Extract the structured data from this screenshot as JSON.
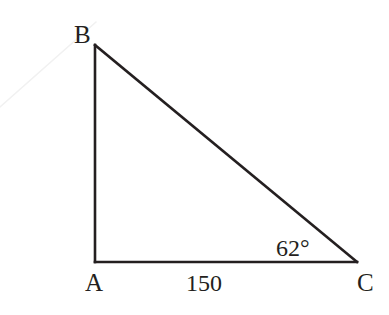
{
  "figure": {
    "background_color": "#ffffff",
    "stroke_color": "#241f20",
    "stroke_width": 2.6,
    "faint_stroke_color": "#f1f1f1",
    "faint_stroke_width": 1.6
  },
  "vertices": {
    "A": {
      "label": "A",
      "x": 95,
      "y": 262
    },
    "B": {
      "label": "B",
      "x": 95,
      "y": 45
    },
    "C": {
      "label": "C",
      "x": 357,
      "y": 262
    }
  },
  "edges": [
    {
      "name": "leg-AB",
      "from": "A",
      "to": "B"
    },
    {
      "name": "hypotenuse-BC",
      "from": "B",
      "to": "C"
    },
    {
      "name": "leg-AC",
      "from": "A",
      "to": "C"
    }
  ],
  "annotations": {
    "side_AC_length": "150",
    "angle_at_C": "62°"
  },
  "artifact": {
    "name": "faint-scan-line",
    "x1": 0,
    "y1": 107,
    "x2": 96,
    "y2": 22
  },
  "chart_data": {
    "type": "diagram",
    "shape": "right-triangle",
    "vertex_labels": [
      "B",
      "A",
      "C"
    ],
    "coordinates": {
      "A": [
        95,
        262
      ],
      "B": [
        95,
        45
      ],
      "C": [
        357,
        262
      ]
    },
    "labeled_side": {
      "side": "AC",
      "value": "150"
    },
    "labeled_angle": {
      "vertex": "C",
      "value": "62°"
    },
    "right_angle_at": "A"
  }
}
